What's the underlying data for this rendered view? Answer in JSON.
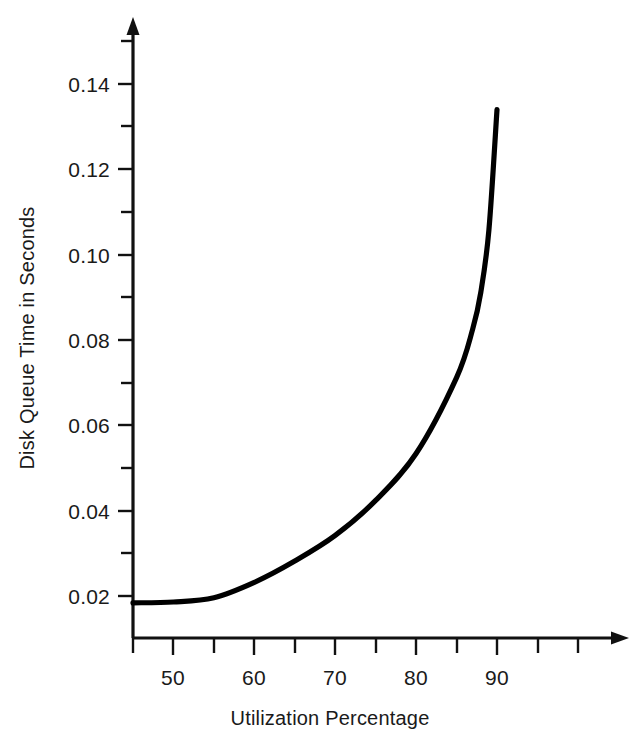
{
  "chart_data": {
    "type": "line",
    "title": "",
    "xlabel": "Utilization Percentage",
    "ylabel": "Disk Queue Time in Seconds",
    "xlim": [
      45,
      101
    ],
    "ylim": [
      0.0105,
      0.1525
    ],
    "grid": false,
    "legend": "none",
    "x_major_ticks": [
      50,
      60,
      70,
      80,
      90
    ],
    "x_minor_ticks": [
      45,
      55,
      65,
      75,
      85,
      95,
      100
    ],
    "x_tick_labels": [
      "50",
      "60",
      "70",
      "80",
      "90"
    ],
    "y_major_ticks": [
      0.02,
      0.04,
      0.06,
      0.08,
      0.1,
      0.12,
      0.14
    ],
    "y_minor_ticks": [
      0.03,
      0.05,
      0.07,
      0.09,
      0.11,
      0.13,
      0.15
    ],
    "y_tick_labels": [
      "0.02",
      "0.04",
      "0.06",
      "0.08",
      "0.10",
      "0.12",
      "0.14"
    ],
    "line_color": "#000000",
    "axis_color": "#111111",
    "background_color": "#ffffff",
    "x": [
      45,
      50,
      55,
      60,
      65,
      70,
      75,
      80,
      85,
      87,
      88,
      89,
      90
    ],
    "y": [
      0.0184,
      0.0186,
      0.0196,
      0.0232,
      0.0282,
      0.0342,
      0.0424,
      0.0534,
      0.0712,
      0.0826,
      0.0912,
      0.1058,
      0.134
    ],
    "series": [
      {
        "name": "Disk Queue Time",
        "values": [
          0.0184,
          0.0186,
          0.0196,
          0.0232,
          0.0282,
          0.0342,
          0.0424,
          0.0534,
          0.0712,
          0.0826,
          0.0912,
          0.1058,
          0.134
        ]
      }
    ],
    "annotations": []
  },
  "axes": {
    "x_axis_name": "x-axis",
    "y_axis_name": "y-axis",
    "x_label_text": "Utilization Percentage",
    "y_label_text": "Disk Queue Time in Seconds"
  },
  "ticks": {
    "y": [
      {
        "value": "0.14"
      },
      {
        "value": "0.12"
      },
      {
        "value": "0.10"
      },
      {
        "value": "0.08"
      },
      {
        "value": "0.06"
      },
      {
        "value": "0.04"
      },
      {
        "value": "0.02"
      }
    ],
    "x": [
      {
        "value": "50"
      },
      {
        "value": "60"
      },
      {
        "value": "70"
      },
      {
        "value": "80"
      },
      {
        "value": "90"
      }
    ]
  }
}
